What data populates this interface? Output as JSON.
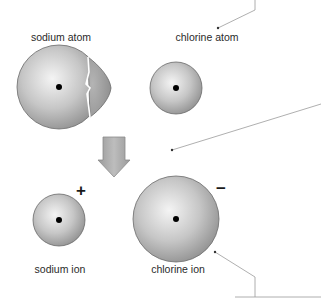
{
  "diagram": {
    "labels": {
      "sodium_atom": "sodium atom",
      "chlorine_atom": "chlorine atom",
      "sodium_ion": "sodium ion",
      "chlorine_ion": "chlorine ion"
    },
    "charges": {
      "sodium_ion": "+",
      "chlorine_ion": "−"
    },
    "colors": {
      "sphere_light": "#f2f2f2",
      "sphere_mid": "#c4c4c4",
      "sphere_dark": "#8e8e8e",
      "outline": "#6a6a6a",
      "electron_shell_torn": "#a2a2a2",
      "arrow": "#a8a8a8",
      "leader_line": "#9a9a9a",
      "nucleus": "#000000"
    },
    "elements": [
      {
        "id": "sodium-atom",
        "cx": 59,
        "cy": 87,
        "r": 42
      },
      {
        "id": "chlorine-atom",
        "cx": 176,
        "cy": 88,
        "r": 26
      },
      {
        "id": "sodium-ion",
        "cx": 59,
        "cy": 220,
        "r": 26
      },
      {
        "id": "chlorine-ion",
        "cx": 176,
        "cy": 219,
        "r": 43
      }
    ]
  }
}
